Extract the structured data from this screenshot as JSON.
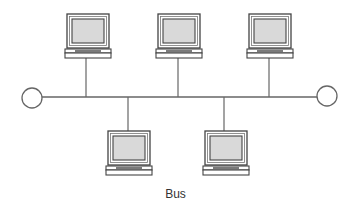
{
  "diagram": {
    "title": "Bus",
    "type": "bus-topology",
    "bus_line": {
      "x1": 42,
      "x2": 317,
      "y": 97,
      "color": "#666666"
    },
    "terminators": [
      {
        "name": "left-terminator",
        "cx": 32,
        "cy": 98,
        "r": 10
      },
      {
        "name": "right-terminator",
        "cx": 327,
        "cy": 96,
        "r": 10
      }
    ],
    "nodes": [
      {
        "name": "computer-top-1",
        "x": 65,
        "y": 14,
        "drop_x": 86,
        "position": "top"
      },
      {
        "name": "computer-top-2",
        "x": 156,
        "y": 14,
        "drop_x": 178,
        "position": "top"
      },
      {
        "name": "computer-top-3",
        "x": 247,
        "y": 14,
        "drop_x": 269,
        "position": "top"
      },
      {
        "name": "computer-bottom-1",
        "x": 106,
        "y": 131,
        "drop_x": 128,
        "position": "bottom"
      },
      {
        "name": "computer-bottom-2",
        "x": 203,
        "y": 131,
        "drop_x": 224,
        "position": "bottom"
      }
    ],
    "colors": {
      "line": "#666666",
      "frame": "#444444",
      "screen": "#d9d9d9",
      "background": "#ffffff"
    }
  }
}
